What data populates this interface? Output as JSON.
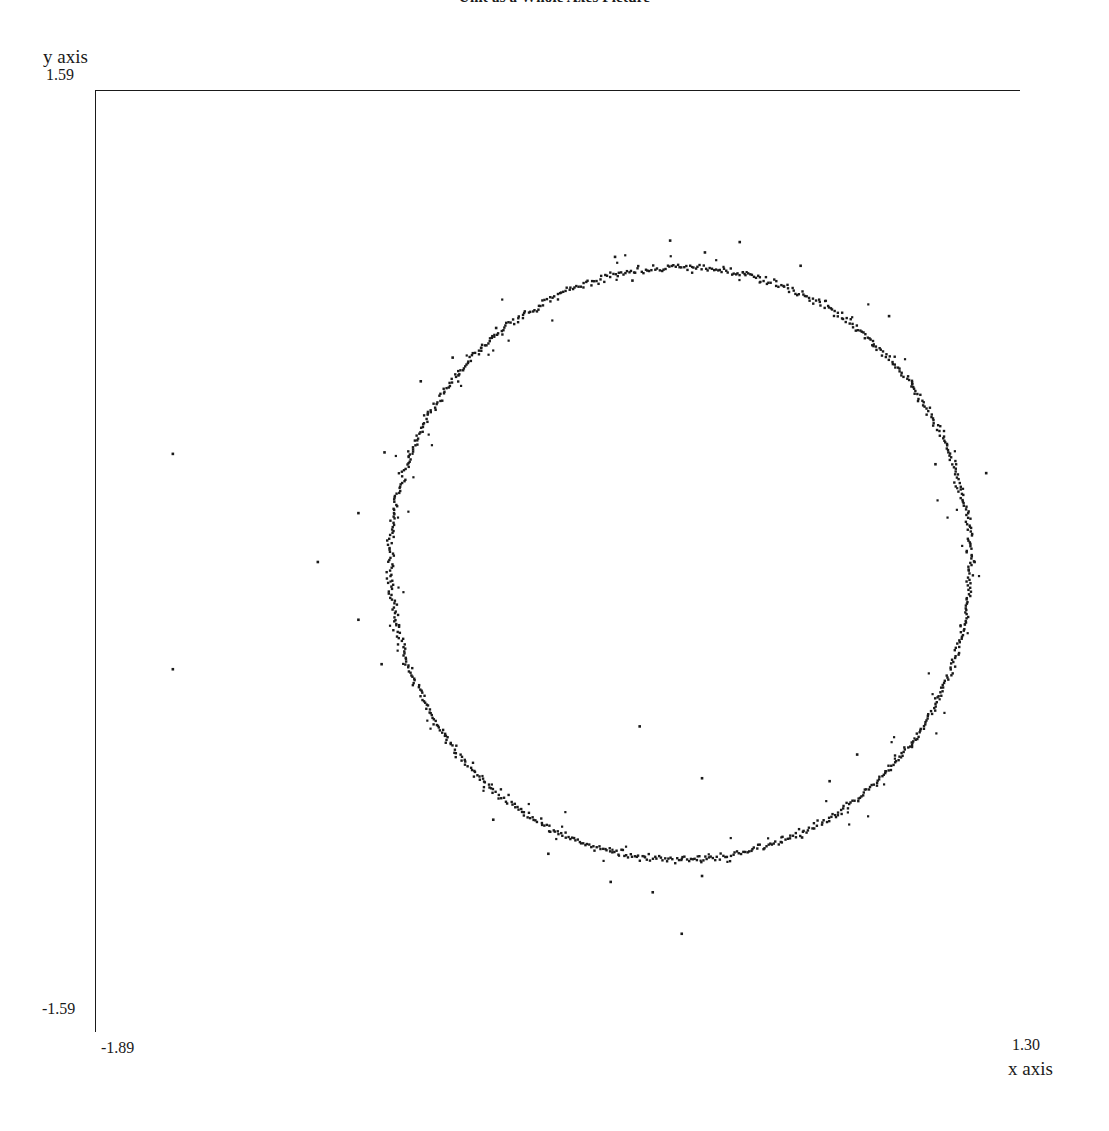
{
  "chart_data": {
    "type": "scatter",
    "title": "Unit as a Whole Axes Picture",
    "xlabel": "x axis",
    "ylabel": "y axis",
    "xlim": [
      -1.89,
      1.3
    ],
    "ylim": [
      -1.59,
      1.59
    ],
    "x_tick_labels": [
      "-1.89",
      "1.30"
    ],
    "y_tick_labels": [
      "-1.59",
      "1.59"
    ],
    "grid": false,
    "legend": null,
    "marker_color": "#1a1a1a",
    "frame_color": "#1a1a1a",
    "background_color": "#ffffff",
    "ring": {
      "center_x": 0.125,
      "center_y": -0.005,
      "radius": 1.0,
      "radial_noise_sigma": 0.006,
      "n_points": 900
    },
    "halo": {
      "radial_noise_sigma": 0.035,
      "n_points": 95
    },
    "outliers": [
      {
        "x": -1.625,
        "y": 0.365
      },
      {
        "x": -1.625,
        "y": -0.362
      },
      {
        "x": -1.125,
        "y": 0.0
      },
      {
        "x": -0.1,
        "y": 1.03
      },
      {
        "x": -0.04,
        "y": 0.95
      },
      {
        "x": 0.09,
        "y": 1.085
      },
      {
        "x": 0.21,
        "y": 1.045
      },
      {
        "x": 0.33,
        "y": 1.08
      },
      {
        "x": 0.54,
        "y": 1.0
      },
      {
        "x": 0.845,
        "y": 0.83
      },
      {
        "x": 0.925,
        "y": 0.6
      },
      {
        "x": 1.005,
        "y": 0.33
      },
      {
        "x": 1.18,
        "y": 0.3
      },
      {
        "x": 1.14,
        "y": 0.0
      },
      {
        "x": 0.64,
        "y": -0.74
      },
      {
        "x": 0.735,
        "y": -0.65
      },
      {
        "x": 0.545,
        "y": -0.93
      },
      {
        "x": 0.2,
        "y": -1.06
      },
      {
        "x": 0.03,
        "y": -1.115
      },
      {
        "x": -0.115,
        "y": -1.08
      },
      {
        "x": -0.33,
        "y": -0.985
      },
      {
        "x": -0.52,
        "y": -0.87
      },
      {
        "x": -0.015,
        "y": -0.555
      },
      {
        "x": 0.2,
        "y": -0.73
      },
      {
        "x": 0.13,
        "y": -1.255
      },
      {
        "x": -0.77,
        "y": 0.61
      },
      {
        "x": -0.66,
        "y": 0.69
      },
      {
        "x": -0.51,
        "y": 0.79
      },
      {
        "x": -0.895,
        "y": 0.37
      },
      {
        "x": -0.985,
        "y": 0.165
      },
      {
        "x": -0.985,
        "y": -0.195
      },
      {
        "x": -0.905,
        "y": -0.345
      },
      {
        "x": -0.64,
        "y": 0.63
      }
    ]
  }
}
